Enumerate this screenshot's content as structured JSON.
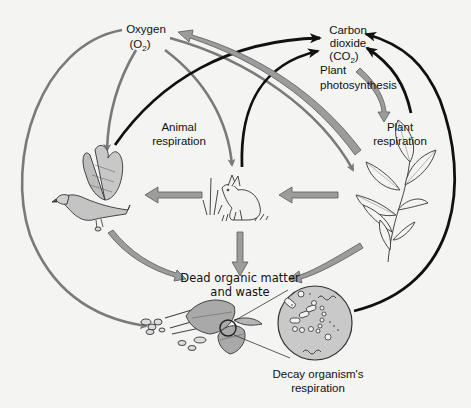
{
  "diagram": {
    "colors": {
      "background": "#f4f4f2",
      "oxygen_arrow": "#7a7a7a",
      "co2_arrow": "#111111",
      "organic_flow_fill": "#9c9c9c",
      "organic_flow_stroke": "#5a5a5a",
      "microbe_circle_fill": "#c9c9c9"
    },
    "nodes": {
      "oxygen": {
        "line1": "Oxygen",
        "formula_main": "(O",
        "formula_sub": "2",
        "formula_close": ")"
      },
      "carbon_dioxide": {
        "line1": "Carbon",
        "line2": "dioxide",
        "formula_main": "(CO",
        "formula_sub": "2",
        "formula_close": ")"
      },
      "plant_photosynthesis": {
        "line1": "Plant",
        "line2": "photosynthesis"
      },
      "plant_respiration": {
        "line1": "Plant",
        "line2": "respiration"
      },
      "animal_respiration": {
        "line1": "Animal",
        "line2": "respiration"
      },
      "dead_organic_matter": {
        "line1": "Dead organic matter",
        "line2": "and waste"
      },
      "decay_respiration": {
        "line1": "Decay organism's",
        "line2": "respiration"
      }
    },
    "organisms": {
      "hawk": "hawk-illustration",
      "rabbit": "rabbit-illustration",
      "plant": "plant-illustration",
      "leaf_litter": "leaf-litter-illustration",
      "microbes": "microbes-magnified-illustration"
    },
    "flows": [
      {
        "from": "plant",
        "to": "oxygen",
        "type": "organic-gray-wide",
        "label": "Plant photosynthesis releases O2"
      },
      {
        "from": "oxygen",
        "to": "hawk",
        "type": "oxygen-gray-thin"
      },
      {
        "from": "oxygen",
        "to": "rabbit",
        "type": "oxygen-gray-thin"
      },
      {
        "from": "oxygen",
        "to": "plant",
        "type": "oxygen-gray-thin"
      },
      {
        "from": "oxygen",
        "to": "leaf_litter",
        "type": "oxygen-gray-thin"
      },
      {
        "from": "hawk",
        "to": "carbon_dioxide",
        "type": "co2-black"
      },
      {
        "from": "rabbit",
        "to": "carbon_dioxide",
        "type": "co2-black"
      },
      {
        "from": "plant",
        "to": "carbon_dioxide",
        "type": "co2-black"
      },
      {
        "from": "microbes",
        "to": "carbon_dioxide",
        "type": "co2-black"
      },
      {
        "from": "carbon_dioxide",
        "to": "plant",
        "type": "organic-gray-wide"
      },
      {
        "from": "rabbit",
        "to": "hawk",
        "type": "organic-gray-wide"
      },
      {
        "from": "plant",
        "to": "rabbit",
        "type": "organic-gray-wide"
      },
      {
        "from": "hawk",
        "to": "dead_organic_matter",
        "type": "organic-gray-wide"
      },
      {
        "from": "rabbit",
        "to": "dead_organic_matter",
        "type": "organic-gray-wide"
      },
      {
        "from": "plant",
        "to": "dead_organic_matter",
        "type": "organic-gray-wide"
      }
    ]
  }
}
